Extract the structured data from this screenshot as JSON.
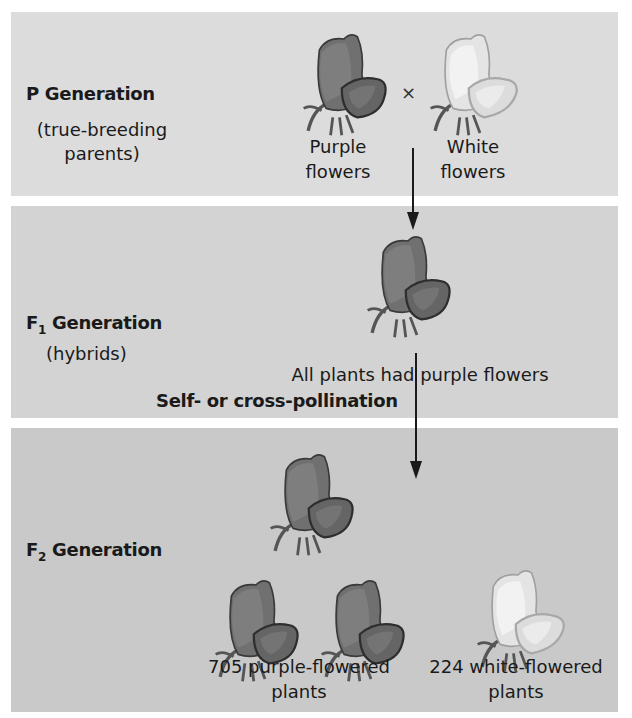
{
  "p_generation": {
    "title": "P Generation",
    "subtitle_line1": "(true-breeding",
    "subtitle_line2": "parents)",
    "cross_symbol": "×",
    "left_flower": {
      "color": "purple",
      "label_line1": "Purple",
      "label_line2": "flowers"
    },
    "right_flower": {
      "color": "white",
      "label_line1": "White",
      "label_line2": "flowers"
    }
  },
  "f1_generation": {
    "title_prefix": "F",
    "title_sub": "1",
    "title_suffix": " Generation",
    "subtitle": "(hybrids)",
    "caption": "All plants had purple flowers",
    "process_label": "Self- or cross-pollination"
  },
  "f2_generation": {
    "title_prefix": "F",
    "title_sub": "2",
    "title_suffix": " Generation",
    "purple_count_label_line1": "705 purple-flowered",
    "purple_count_label_line2": "plants",
    "white_count_label_line1": "224 white-flowered",
    "white_count_label_line2": "plants",
    "purple_count": 705,
    "white_count": 224
  },
  "colors": {
    "panel_p": "#dcdcdc",
    "panel_f1": "#d3d3d3",
    "panel_f2": "#c9c9c9",
    "purple_flower": "#6a6a6a",
    "white_flower": "#ececec"
  }
}
